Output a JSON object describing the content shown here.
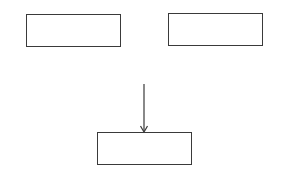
{
  "diagram": {
    "type": "block-diagram",
    "background": "#ffffff",
    "stroke_color": "#3a3a3a",
    "boxes": [
      {
        "id": "top-left",
        "label": "",
        "x": 26,
        "y": 14,
        "width": 95,
        "height": 33
      },
      {
        "id": "top-right",
        "label": "",
        "x": 168,
        "y": 13,
        "width": 95,
        "height": 33
      },
      {
        "id": "bottom-center",
        "label": "",
        "x": 97,
        "y": 132,
        "width": 95,
        "height": 33
      }
    ],
    "arrows": [
      {
        "id": "arrow-to-bottom",
        "from": [
          144,
          84
        ],
        "to": [
          144,
          132
        ],
        "target": "bottom-center",
        "head": "end"
      }
    ]
  }
}
